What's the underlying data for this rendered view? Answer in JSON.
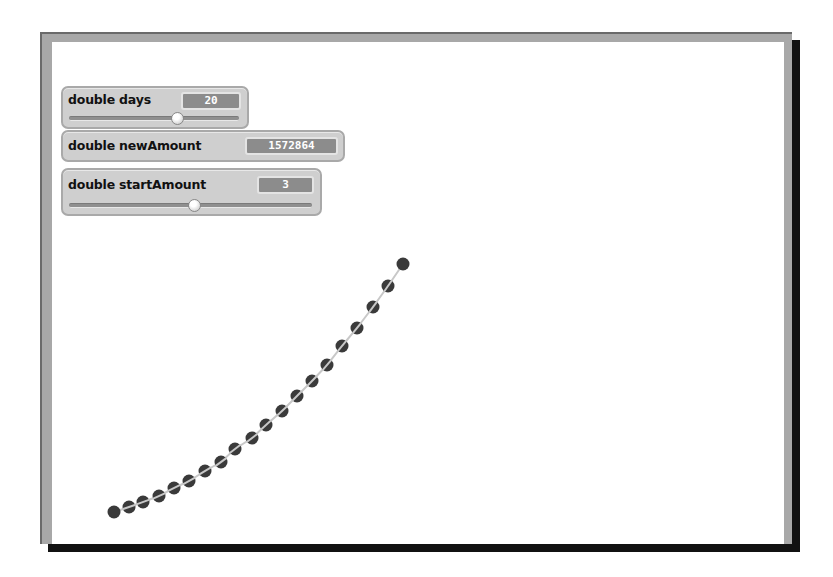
{
  "monitors": [
    {
      "label": "double days",
      "value": "20",
      "has_slider": true
    },
    {
      "label": "double newAmount",
      "value": "1572864",
      "has_slider": false
    },
    {
      "label": "double startAmount",
      "value": "3",
      "has_slider": true
    }
  ],
  "colors": {
    "dot": "#3a3a3a",
    "line": "#c8c8c8",
    "monitor_bg": "#cfcfcf",
    "value_bg": "#8c8c8c",
    "frame": "#a8a8a8"
  },
  "plot": {
    "point_count": 20,
    "points": [
      [
        114,
        512
      ],
      [
        129,
        507
      ],
      [
        143,
        502
      ],
      [
        159,
        496
      ],
      [
        174,
        488
      ],
      [
        189,
        481
      ],
      [
        205,
        471
      ],
      [
        221,
        462
      ],
      [
        235,
        449
      ],
      [
        252,
        438
      ],
      [
        266,
        425
      ],
      [
        282,
        411
      ],
      [
        297,
        396
      ],
      [
        312,
        381
      ],
      [
        327,
        365
      ],
      [
        342,
        346
      ],
      [
        357,
        328
      ],
      [
        373,
        307
      ],
      [
        388,
        286
      ],
      [
        403,
        264
      ]
    ]
  }
}
